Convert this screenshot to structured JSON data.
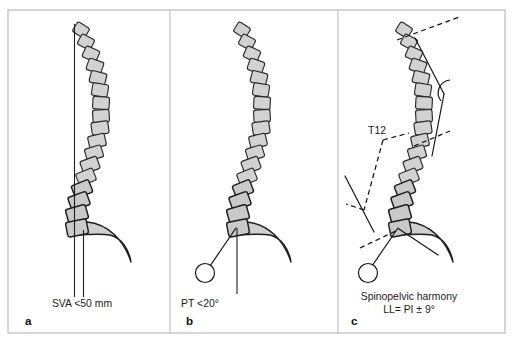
{
  "figure": {
    "background_color": "#ffffff",
    "frame_color": "#b4b4b4",
    "vertebra_fill": "#d2d2d2",
    "vertebra_stroke": "#2a2a2a",
    "sacrum_fill": "#cfcfcf",
    "line_color": "#141414",
    "frame": {
      "x": 8,
      "y": 10,
      "width": 497,
      "height": 323
    },
    "dividers": [
      {
        "x1": 170,
        "y1": 10,
        "x2": 170,
        "y2": 333
      },
      {
        "x1": 338,
        "y1": 10,
        "x2": 338,
        "y2": 333
      }
    ]
  },
  "panels": [
    {
      "id": "panel-a",
      "letter": "a",
      "letter_pos": {
        "x": 25,
        "y": 325
      },
      "caption_lines": [
        {
          "text": "SVA <50 mm",
          "x": 82,
          "y": 307
        }
      ],
      "annotations": [],
      "spine_origin": {
        "x": 79,
        "y": 22
      },
      "plumb_lines": [
        {
          "x1": 74.5,
          "y1": 24,
          "x2": 74.5,
          "y2": 297,
          "name": "c7-plumb-line"
        },
        {
          "x1": 83.5,
          "y1": 230,
          "x2": 83.5,
          "y2": 297,
          "name": "sacral-vertical-line"
        }
      ],
      "measure_lines": [],
      "dashed_lines": [],
      "arcs": [],
      "femoral_head": null,
      "sacrum": {
        "path": "M 70 228 L 87 222 C 108 224 124 240 131 262 C 129 250 122 238 110 235 C 96 233 80 236 70 234 Z",
        "name": "sacrum-shape"
      },
      "vertebrae": [
        {
          "cx": 81,
          "cy": 30,
          "w": 14,
          "h": 11.5,
          "rot": 32,
          "group": "thoracic"
        },
        {
          "cx": 86,
          "cy": 42,
          "w": 14.5,
          "h": 11.5,
          "rot": 28,
          "group": "thoracic"
        },
        {
          "cx": 91,
          "cy": 54,
          "w": 15,
          "h": 12,
          "rot": 24,
          "group": "thoracic"
        },
        {
          "cx": 95,
          "cy": 66,
          "w": 15.5,
          "h": 12,
          "rot": 19,
          "group": "thoracic"
        },
        {
          "cx": 98,
          "cy": 78,
          "w": 16,
          "h": 12,
          "rot": 14,
          "group": "thoracic"
        },
        {
          "cx": 100,
          "cy": 90,
          "w": 16,
          "h": 12.5,
          "rot": 9,
          "group": "thoracic"
        },
        {
          "cx": 101,
          "cy": 103,
          "w": 16.5,
          "h": 12.5,
          "rot": 3,
          "group": "thoracic"
        },
        {
          "cx": 101,
          "cy": 116,
          "w": 16.5,
          "h": 12.5,
          "rot": -3,
          "group": "thoracic"
        },
        {
          "cx": 100,
          "cy": 128,
          "w": 17,
          "h": 12.5,
          "rot": -8,
          "group": "thoracic"
        },
        {
          "cx": 97,
          "cy": 141,
          "w": 17,
          "h": 12.5,
          "rot": -13,
          "group": "thoracic"
        },
        {
          "cx": 94,
          "cy": 153,
          "w": 17,
          "h": 12.5,
          "rot": -17,
          "group": "thoracic"
        },
        {
          "cx": 90,
          "cy": 165,
          "w": 17.5,
          "h": 13,
          "rot": -20,
          "group": "thoracic"
        },
        {
          "cx": 86,
          "cy": 177,
          "w": 18,
          "h": 13,
          "rot": -22,
          "group": "thoracic"
        },
        {
          "cx": 82,
          "cy": 189,
          "w": 18.5,
          "h": 13.5,
          "rot": -22,
          "group": "lumbar"
        },
        {
          "cx": 79,
          "cy": 201,
          "w": 19.5,
          "h": 14,
          "rot": -20,
          "group": "lumbar"
        },
        {
          "cx": 77,
          "cy": 214,
          "w": 20.5,
          "h": 14.5,
          "rot": -16,
          "group": "lumbar"
        },
        {
          "cx": 77,
          "cy": 228,
          "w": 21,
          "h": 15,
          "rot": -11,
          "group": "lumbar"
        }
      ]
    },
    {
      "id": "panel-b",
      "letter": "b",
      "letter_pos": {
        "x": 186,
        "y": 325
      },
      "caption_lines": [
        {
          "text": "PT <20°",
          "x": 200,
          "y": 307
        }
      ],
      "annotations": [],
      "spine_origin": {
        "x": 240,
        "y": 22
      },
      "plumb_lines": [
        {
          "x1": 237,
          "y1": 228,
          "x2": 237,
          "y2": 294,
          "name": "pelvic-vertical-reference-line"
        }
      ],
      "measure_lines": [
        {
          "x1": 236,
          "y1": 228,
          "x2": 210,
          "y2": 266,
          "name": "pelvic-tilt-line"
        }
      ],
      "dashed_lines": [],
      "arcs": [],
      "femoral_head": {
        "cx": 205,
        "cy": 273,
        "r": 9.5,
        "name": "femoral-head-circle"
      },
      "sacrum": {
        "path": "M 230 228 L 247 222 C 268 224 284 240 291 262 C 289 250 282 238 270 235 C 256 233 240 236 230 234 Z",
        "name": "sacrum-shape"
      },
      "vertebrae": [
        {
          "cx": 242,
          "cy": 30,
          "w": 14,
          "h": 11.5,
          "rot": 32,
          "group": "thoracic"
        },
        {
          "cx": 247,
          "cy": 42,
          "w": 14.5,
          "h": 11.5,
          "rot": 28,
          "group": "thoracic"
        },
        {
          "cx": 252,
          "cy": 54,
          "w": 15,
          "h": 12,
          "rot": 24,
          "group": "thoracic"
        },
        {
          "cx": 256,
          "cy": 66,
          "w": 15.5,
          "h": 12,
          "rot": 19,
          "group": "thoracic"
        },
        {
          "cx": 259,
          "cy": 78,
          "w": 16,
          "h": 12,
          "rot": 14,
          "group": "thoracic"
        },
        {
          "cx": 261,
          "cy": 90,
          "w": 16,
          "h": 12.5,
          "rot": 9,
          "group": "thoracic"
        },
        {
          "cx": 262,
          "cy": 103,
          "w": 16.5,
          "h": 12.5,
          "rot": 3,
          "group": "thoracic"
        },
        {
          "cx": 262,
          "cy": 116,
          "w": 16.5,
          "h": 12.5,
          "rot": -3,
          "group": "thoracic"
        },
        {
          "cx": 261,
          "cy": 128,
          "w": 17,
          "h": 12.5,
          "rot": -8,
          "group": "thoracic"
        },
        {
          "cx": 258,
          "cy": 141,
          "w": 17,
          "h": 12.5,
          "rot": -13,
          "group": "thoracic"
        },
        {
          "cx": 255,
          "cy": 153,
          "w": 17,
          "h": 12.5,
          "rot": -17,
          "group": "thoracic"
        },
        {
          "cx": 251,
          "cy": 165,
          "w": 17.5,
          "h": 13,
          "rot": -20,
          "group": "thoracic"
        },
        {
          "cx": 247,
          "cy": 177,
          "w": 18,
          "h": 13,
          "rot": -22,
          "group": "thoracic"
        },
        {
          "cx": 243,
          "cy": 189,
          "w": 18.5,
          "h": 13.5,
          "rot": -22,
          "group": "lumbar"
        },
        {
          "cx": 240,
          "cy": 201,
          "w": 19.5,
          "h": 14,
          "rot": -20,
          "group": "lumbar"
        },
        {
          "cx": 238,
          "cy": 214,
          "w": 20.5,
          "h": 14.5,
          "rot": -16,
          "group": "lumbar"
        },
        {
          "cx": 238,
          "cy": 228,
          "w": 21,
          "h": 15,
          "rot": -11,
          "group": "lumbar"
        }
      ]
    },
    {
      "id": "panel-c",
      "letter": "c",
      "letter_pos": {
        "x": 351,
        "y": 325
      },
      "caption_lines": [
        {
          "text": "Spinopelvic harmony",
          "x": 409,
          "y": 300
        },
        {
          "text": "LL= PI ± 9°",
          "x": 409,
          "y": 313
        }
      ],
      "annotations": [
        {
          "text": "T12",
          "x": 377,
          "y": 134,
          "name": "t12-label"
        }
      ],
      "spine_origin": {
        "x": 402,
        "y": 22
      },
      "plumb_lines": [],
      "measure_lines": [
        {
          "x1": 415,
          "y1": 38,
          "x2": 444,
          "y2": 94,
          "name": "kyphosis-upper-perpendicular"
        },
        {
          "x1": 432,
          "y1": 156,
          "x2": 444,
          "y2": 94,
          "name": "kyphosis-lower-perpendicular"
        },
        {
          "x1": 345,
          "y1": 176,
          "x2": 374,
          "y2": 232,
          "name": "lordosis-lower-perpendicular"
        },
        {
          "x1": 398,
          "y1": 228,
          "x2": 372,
          "y2": 266,
          "name": "pelvic-tilt-line"
        },
        {
          "x1": 399,
          "y1": 229,
          "x2": 438,
          "y2": 255,
          "name": "sacral-slope-line"
        }
      ],
      "dashed_lines": [
        {
          "x1": 397,
          "y1": 40,
          "x2": 459,
          "y2": 17,
          "name": "t1-endplate-dashed-line"
        },
        {
          "x1": 414,
          "y1": 146,
          "x2": 450,
          "y2": 131,
          "name": "t12-endplate-dashed-line"
        },
        {
          "x1": 383,
          "y1": 140,
          "x2": 364,
          "y2": 210,
          "name": "lordosis-reference-dashed-line"
        },
        {
          "x1": 383,
          "y1": 140,
          "x2": 409,
          "y2": 133,
          "name": "t12-marker-dashed-line"
        },
        {
          "x1": 364,
          "y1": 210,
          "x2": 346,
          "y2": 204,
          "name": "lordosis-lower-dashed-tick"
        },
        {
          "x1": 360,
          "y1": 248,
          "x2": 400,
          "y2": 229,
          "name": "sacral-endplate-dashed-line"
        }
      ],
      "arcs": [
        {
          "path": "M 450 80 A 13 13 0 0 0 441 101",
          "name": "kyphosis-angle-arc"
        }
      ],
      "femoral_head": {
        "cx": 368,
        "cy": 273,
        "r": 9.5,
        "name": "femoral-head-circle"
      },
      "sacrum": {
        "path": "M 392 228 L 409 222 C 430 224 446 240 453 262 C 451 250 444 238 432 235 C 418 233 402 236 392 234 Z",
        "name": "sacrum-shape"
      },
      "vertebrae": [
        {
          "cx": 404,
          "cy": 30,
          "w": 14,
          "h": 11.5,
          "rot": 32,
          "group": "thoracic"
        },
        {
          "cx": 409,
          "cy": 42,
          "w": 14.5,
          "h": 11.5,
          "rot": 28,
          "group": "thoracic"
        },
        {
          "cx": 414,
          "cy": 54,
          "w": 15,
          "h": 12,
          "rot": 24,
          "group": "thoracic"
        },
        {
          "cx": 418,
          "cy": 66,
          "w": 15.5,
          "h": 12,
          "rot": 19,
          "group": "thoracic"
        },
        {
          "cx": 421,
          "cy": 78,
          "w": 16,
          "h": 12,
          "rot": 14,
          "group": "thoracic"
        },
        {
          "cx": 423,
          "cy": 90,
          "w": 16,
          "h": 12.5,
          "rot": 9,
          "group": "thoracic"
        },
        {
          "cx": 424,
          "cy": 103,
          "w": 16.5,
          "h": 12.5,
          "rot": 3,
          "group": "thoracic"
        },
        {
          "cx": 424,
          "cy": 116,
          "w": 16.5,
          "h": 12.5,
          "rot": -3,
          "group": "thoracic"
        },
        {
          "cx": 423,
          "cy": 128,
          "w": 17,
          "h": 12.5,
          "rot": -8,
          "group": "thoracic"
        },
        {
          "cx": 420,
          "cy": 141,
          "w": 17,
          "h": 12.5,
          "rot": -13,
          "group": "thoracic"
        },
        {
          "cx": 417,
          "cy": 153,
          "w": 17,
          "h": 12.5,
          "rot": -17,
          "group": "thoracic"
        },
        {
          "cx": 413,
          "cy": 165,
          "w": 17.5,
          "h": 13,
          "rot": -20,
          "group": "thoracic"
        },
        {
          "cx": 409,
          "cy": 177,
          "w": 18,
          "h": 13,
          "rot": -22,
          "group": "thoracic"
        },
        {
          "cx": 405,
          "cy": 189,
          "w": 18.5,
          "h": 13.5,
          "rot": -22,
          "group": "lumbar"
        },
        {
          "cx": 402,
          "cy": 201,
          "w": 19.5,
          "h": 14,
          "rot": -20,
          "group": "lumbar"
        },
        {
          "cx": 400,
          "cy": 214,
          "w": 20.5,
          "h": 14.5,
          "rot": -16,
          "group": "lumbar"
        },
        {
          "cx": 400,
          "cy": 228,
          "w": 21,
          "h": 15,
          "rot": -11,
          "group": "lumbar"
        }
      ]
    }
  ]
}
